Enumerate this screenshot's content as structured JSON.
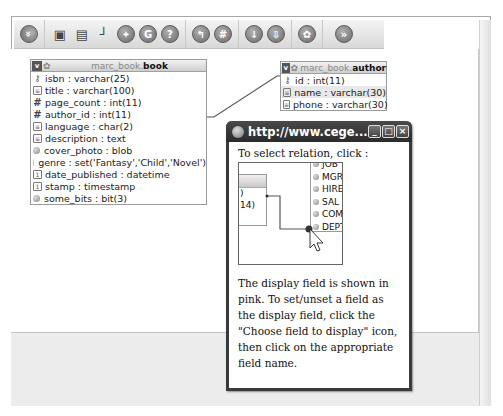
{
  "toolbar": {
    "groups": [
      [
        {
          "name": "collapse-toolbar",
          "glyph": "»"
        }
      ],
      [
        {
          "name": "save-position",
          "glyph": "▣"
        },
        {
          "name": "show-table-list",
          "glyph": "▤"
        },
        {
          "name": "toggle-relation-lines",
          "glyph": "┘"
        },
        {
          "name": "create-relation",
          "glyph": "✦"
        },
        {
          "name": "reload",
          "glyph": "G"
        },
        {
          "name": "help",
          "glyph": "?"
        }
      ],
      [
        {
          "name": "angular-links",
          "glyph": "↰"
        },
        {
          "name": "snap-to-grid",
          "glyph": "#"
        }
      ],
      [
        {
          "name": "small-big-all",
          "glyph": "↓"
        },
        {
          "name": "toggle-small-big",
          "glyph": "⇩"
        }
      ],
      [
        {
          "name": "export-pdf",
          "glyph": "✿"
        }
      ],
      [
        {
          "name": "expand-toolbar",
          "glyph": "»"
        }
      ]
    ]
  },
  "tables": [
    {
      "schema": "marc_book.",
      "name": "book",
      "toggle": "v",
      "fields": [
        {
          "icon": "key",
          "label": "isbn : varchar(25)"
        },
        {
          "icon": "text",
          "label": "title : varchar(100)"
        },
        {
          "icon": "number",
          "label": "page_count : int(11)"
        },
        {
          "icon": "number",
          "label": "author_id : int(11)"
        },
        {
          "icon": "text",
          "label": "language : char(2)"
        },
        {
          "icon": "text",
          "label": "description : text"
        },
        {
          "icon": "other",
          "label": "cover_photo : blob"
        },
        {
          "icon": "other",
          "label": "genre : set('Fantasy','Child','Novel')"
        },
        {
          "icon": "date",
          "label": "date_published : datetime"
        },
        {
          "icon": "date",
          "label": "stamp : timestamp"
        },
        {
          "icon": "other",
          "label": "some_bits : bit(3)"
        }
      ]
    },
    {
      "schema": "marc_book.",
      "name": "author",
      "toggle": "v",
      "fields": [
        {
          "icon": "key",
          "label": "id : int(11)"
        },
        {
          "icon": "text",
          "label": "name : varchar(30)",
          "display_field": true
        },
        {
          "icon": "text",
          "label": "phone : varchar(30)"
        }
      ]
    }
  ],
  "popup": {
    "title": "http://www.cege...",
    "buttons": {
      "minimize": "_",
      "maximize": "□",
      "close": "×"
    },
    "intro": "To select relation, click :",
    "mini_diagram": {
      "left_rows": [
        ")",
        "14)"
      ],
      "right_rows": [
        "JOB",
        "MGR",
        "HIRE",
        "SAL",
        "COM",
        "DEPT"
      ]
    },
    "description": "The display field is shown in pink. To set/unset a field as the display field, click the \"Choose field to display\" icon, then click on the appropriate field name."
  }
}
